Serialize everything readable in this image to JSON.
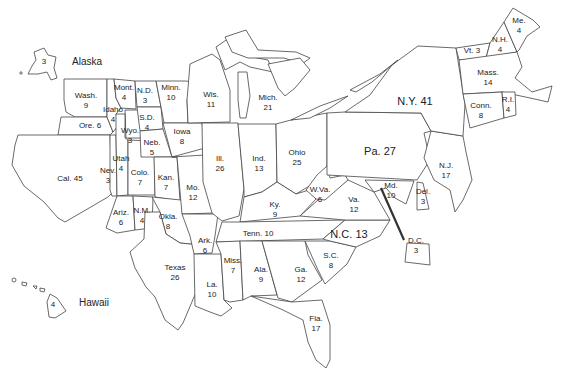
{
  "map": {
    "type": "us-states-electoral-votes",
    "states": [
      {
        "abbr": "Alaska",
        "value": "3",
        "x": 44,
        "y": 62,
        "name_x": 72,
        "name_y": 62
      },
      {
        "abbr": "Hawaii",
        "value": "4",
        "x": 53,
        "y": 305,
        "name_x": 79,
        "name_y": 303
      },
      {
        "abbr": "Wash.",
        "value": "9",
        "x": 86,
        "y": 101
      },
      {
        "abbr": "Ore.",
        "value": "6",
        "x": 90,
        "y": 126,
        "inline": true
      },
      {
        "abbr": "Cal.",
        "value": "45",
        "x": 70,
        "y": 179,
        "inline": true
      },
      {
        "abbr": "Idaho",
        "value": "4",
        "x": 113,
        "y": 115,
        "value_x": 114,
        "value_y": 114
      },
      {
        "abbr": "Nev.",
        "value": "3",
        "x": 108,
        "y": 176
      },
      {
        "abbr": "Mont.",
        "value": "4",
        "x": 124,
        "y": 93
      },
      {
        "abbr": "Wyo.",
        "value": "3",
        "x": 130,
        "y": 136
      },
      {
        "abbr": "Utah",
        "value": "4",
        "x": 121,
        "y": 164
      },
      {
        "abbr": "Colo.",
        "value": "7",
        "x": 140,
        "y": 178
      },
      {
        "abbr": "Ariz.",
        "value": "6",
        "x": 121,
        "y": 218
      },
      {
        "abbr": "N.M.",
        "value": "4",
        "x": 142,
        "y": 216
      },
      {
        "abbr": "N.D.",
        "value": "3",
        "x": 145,
        "y": 96
      },
      {
        "abbr": "S.D.",
        "value": "4",
        "x": 147,
        "y": 123
      },
      {
        "abbr": "Neb.",
        "value": "5",
        "x": 152,
        "y": 148
      },
      {
        "abbr": "Kan.",
        "value": "7",
        "x": 166,
        "y": 183
      },
      {
        "abbr": "Okla.",
        "value": "8",
        "x": 168,
        "y": 222
      },
      {
        "abbr": "Texas",
        "value": "26",
        "x": 175,
        "y": 273
      },
      {
        "abbr": "Minn.",
        "value": "10",
        "x": 171,
        "y": 93
      },
      {
        "abbr": "Iowa",
        "value": "8",
        "x": 182,
        "y": 137
      },
      {
        "abbr": "Mo.",
        "value": "12",
        "x": 193,
        "y": 193
      },
      {
        "abbr": "Ark.",
        "value": "6",
        "x": 205,
        "y": 246
      },
      {
        "abbr": "La.",
        "value": "10",
        "x": 212,
        "y": 290
      },
      {
        "abbr": "Wis.",
        "value": "11",
        "x": 211,
        "y": 100
      },
      {
        "abbr": "Ill.",
        "value": "26",
        "x": 220,
        "y": 164
      },
      {
        "abbr": "Mich.",
        "value": "21",
        "x": 268,
        "y": 103
      },
      {
        "abbr": "Ind.",
        "value": "13",
        "x": 259,
        "y": 164
      },
      {
        "abbr": "Ohio",
        "value": "25",
        "x": 297,
        "y": 158
      },
      {
        "abbr": "Ky.",
        "value": "9",
        "x": 275,
        "y": 210
      },
      {
        "abbr": "Tenn.",
        "value": "10",
        "x": 258,
        "y": 234,
        "inline": true
      },
      {
        "abbr": "Miss.",
        "value": "7",
        "x": 233,
        "y": 266
      },
      {
        "abbr": "Ala.",
        "value": "9",
        "x": 261,
        "y": 275
      },
      {
        "abbr": "Ga.",
        "value": "12",
        "x": 301,
        "y": 275
      },
      {
        "abbr": "Fla.",
        "value": "17",
        "x": 316,
        "y": 324
      },
      {
        "abbr": "S.C.",
        "value": "8",
        "x": 331,
        "y": 261
      },
      {
        "abbr": "N.C.",
        "value": "13",
        "x": 349,
        "y": 234,
        "inline": true,
        "big": true
      },
      {
        "abbr": "Va.",
        "value": "12",
        "x": 354,
        "y": 205
      },
      {
        "abbr": "W.Va.",
        "value": "6",
        "x": 320,
        "y": 195
      },
      {
        "abbr": "Md.",
        "value": "10",
        "x": 391,
        "y": 191
      },
      {
        "abbr": "Del.",
        "value": "3",
        "x": 423,
        "y": 197
      },
      {
        "abbr": "D.C.",
        "value": "3",
        "x": 416,
        "y": 246
      },
      {
        "abbr": "Pa.",
        "value": "27",
        "x": 380,
        "y": 151,
        "inline": true,
        "big": true
      },
      {
        "abbr": "N.J.",
        "value": "17",
        "x": 446,
        "y": 171
      },
      {
        "abbr": "N.Y.",
        "value": "41",
        "x": 415,
        "y": 101,
        "inline": true,
        "big": true
      },
      {
        "abbr": "Vt.",
        "value": "3",
        "x": 472,
        "y": 51,
        "inline": true
      },
      {
        "abbr": "N.H.",
        "value": "4",
        "x": 500,
        "y": 45
      },
      {
        "abbr": "Me.",
        "value": "4",
        "x": 519,
        "y": 26
      },
      {
        "abbr": "Mass.",
        "value": "14",
        "x": 488,
        "y": 78
      },
      {
        "abbr": "Conn.",
        "value": "8",
        "x": 481,
        "y": 111
      },
      {
        "abbr": "R.I.",
        "value": "4",
        "x": 508,
        "y": 105
      }
    ],
    "lake_label": "Lake Michigan"
  }
}
